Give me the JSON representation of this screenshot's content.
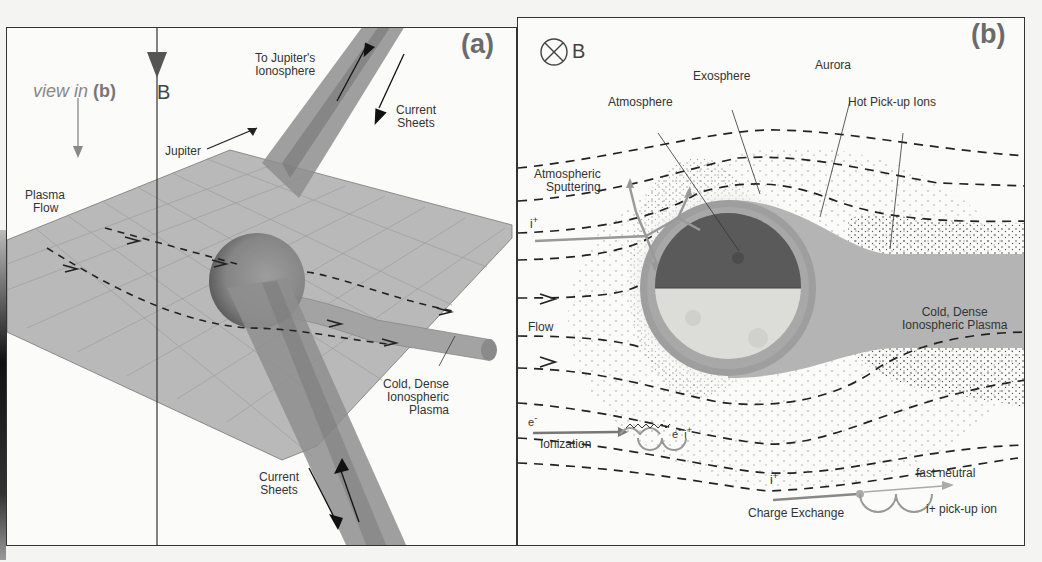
{
  "figure": {
    "panel_a": {
      "tag": "(a)",
      "view_in_label": "view in",
      "view_in_ref": "(b)",
      "field_label": "B",
      "labels": {
        "to_ionosphere": [
          "To Jupiter's",
          "Ionosphere"
        ],
        "current_sheets_top": [
          "Current",
          "Sheets"
        ],
        "jupiter": "Jupiter",
        "plasma_flow": [
          "Plasma",
          "Flow"
        ],
        "cold_dense": [
          "Cold, Dense",
          "Ionospheric",
          "Plasma"
        ],
        "current_sheets_bottom": [
          "Current",
          "Sheets"
        ]
      }
    },
    "panel_b": {
      "tag": "(b)",
      "field_symbol": "⊗",
      "field_label": "B",
      "labels": {
        "exosphere": "Exosphere",
        "aurora": "Aurora",
        "atmosphere": "Atmosphere",
        "hot_pickup_ions": "Hot Pick-up Ions",
        "atmospheric_sputtering": [
          "Atmospheric",
          "Sputtering"
        ],
        "ion_in": "i",
        "ion_sup": "+",
        "flow": "Flow",
        "cold_dense": [
          "Cold, Dense",
          "Ionospheric Plasma"
        ],
        "electron": "e",
        "electron_sup": "-",
        "ionization": "Ionization",
        "ionization_e": "e",
        "ionization_e_sup": "-",
        "ionization_i": "i",
        "ionization_i_sup": "+",
        "exchange_ion": "i",
        "exchange_ion_sup": "+",
        "fast_neutral": "fast neutral",
        "charge_exchange": "Charge Exchange",
        "pickup_ion": "i+ pick-up ion"
      }
    }
  }
}
